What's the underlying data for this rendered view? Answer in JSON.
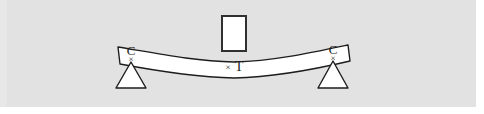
{
  "figure": {
    "type": "engineering-diagram",
    "background_color": "#e2e2e2",
    "page_color": "#ffffff",
    "stroke_color": "#1d1d1d",
    "fill_color": "#ffffff"
  },
  "beam": {
    "name": "beam",
    "fill": "#ffffff",
    "stroke": "#1d1d1d"
  },
  "load": {
    "name": "load-block",
    "fill": "#ffffff",
    "stroke": "#303030"
  },
  "supports": {
    "left": {
      "name": "left-pin-support",
      "fill": "#ffffff",
      "stroke": "#1d1d1d"
    },
    "right": {
      "name": "right-pin-support",
      "fill": "#ffffff",
      "stroke": "#1d1d1d"
    }
  },
  "labels": {
    "compression_left": "C",
    "compression_right": "C",
    "tension": "T",
    "mark_left": "×",
    "mark_right": "×",
    "mark_center": "×"
  }
}
